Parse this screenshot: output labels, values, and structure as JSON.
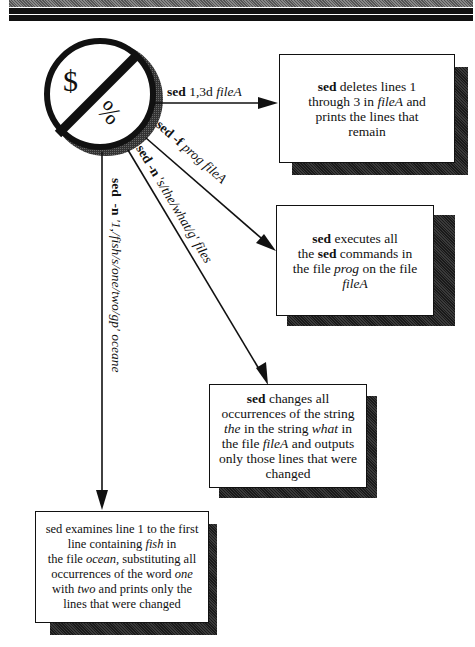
{
  "symbol": {
    "left": "$",
    "right": "%"
  },
  "arrows": [
    {
      "cmd": "sed",
      "args": "1,3d",
      "file": "fileA"
    },
    {
      "cmd": "sed",
      "opt": "-f",
      "args": "prog",
      "file": "fileA"
    },
    {
      "cmd": "sed",
      "opt": "-n",
      "args": "'s/the/what/g'",
      "file": "files"
    },
    {
      "cmd": "sed",
      "opt": "-n",
      "args": "'1,/fish/s/one/two/gp'",
      "file": "oceane"
    }
  ],
  "boxes": [
    {
      "lines": [
        [
          {
            "t": "sed",
            "b": true
          },
          {
            "t": " deletes lines 1"
          }
        ],
        [
          {
            "t": "through 3 in "
          },
          {
            "t": "fileA",
            "i": true
          },
          {
            "t": "  and"
          }
        ],
        [
          {
            "t": "prints the lines that"
          }
        ],
        [
          {
            "t": "remain"
          }
        ]
      ]
    },
    {
      "lines": [
        [
          {
            "t": "sed",
            "b": true
          },
          {
            "t": "  executes all"
          }
        ],
        [
          {
            "t": "the "
          },
          {
            "t": "sed",
            "b": true
          },
          {
            "t": " commands in"
          }
        ],
        [
          {
            "t": "the file "
          },
          {
            "t": "prog",
            "i": true
          },
          {
            "t": " on the file"
          }
        ],
        [
          {
            "t": "fileA",
            "i": true
          }
        ]
      ]
    },
    {
      "lines": [
        [
          {
            "t": "sed",
            "b": true
          },
          {
            "t": " changes all"
          }
        ],
        [
          {
            "t": "occurrences of the string"
          }
        ],
        [
          {
            "t": "the",
            "i": true
          },
          {
            "t": "  in the string "
          },
          {
            "t": "what",
            "i": true
          },
          {
            "t": "  in"
          }
        ],
        [
          {
            "t": "the file "
          },
          {
            "t": "fileA",
            "i": true
          },
          {
            "t": "  and outputs"
          }
        ],
        [
          {
            "t": "only those lines that were"
          }
        ],
        [
          {
            "t": "changed"
          }
        ]
      ]
    },
    {
      "lines": [
        [
          {
            "t": "sed examines line 1 to the first"
          }
        ],
        [
          {
            "t": "line containing "
          },
          {
            "t": "fish",
            "i": true
          },
          {
            "t": " in"
          }
        ],
        [
          {
            "t": "the file "
          },
          {
            "t": "ocean,",
            "i": true
          },
          {
            "t": "  substituting all"
          }
        ],
        [
          {
            "t": "occurrences of the word "
          },
          {
            "t": "one",
            "i": true
          }
        ],
        [
          {
            "t": "with "
          },
          {
            "t": "two",
            "i": true
          },
          {
            "t": " and prints only the"
          }
        ],
        [
          {
            "t": "lines that were changed"
          }
        ]
      ]
    }
  ]
}
